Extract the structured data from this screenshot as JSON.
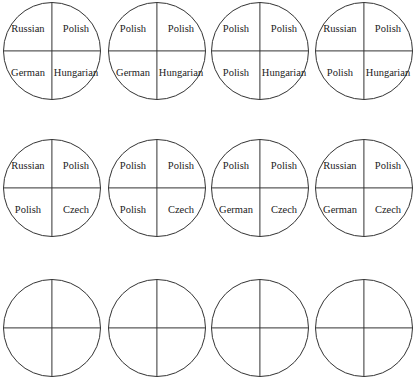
{
  "layout": {
    "rows": 3,
    "cols": 4,
    "colCenters": [
      52,
      157,
      260,
      364
    ],
    "rowCenters": [
      51,
      188,
      328
    ],
    "radius": 49
  },
  "circles": [
    {
      "row": 0,
      "col": 0,
      "tl": "Russian",
      "tr": "Polish",
      "bl": "German",
      "br": "Hungarian"
    },
    {
      "row": 0,
      "col": 1,
      "tl": "Polish",
      "tr": "Polish",
      "bl": "German",
      "br": "Hungarian"
    },
    {
      "row": 0,
      "col": 2,
      "tl": "Polish",
      "tr": "Polish",
      "bl": "Polish",
      "br": "Hungarian"
    },
    {
      "row": 0,
      "col": 3,
      "tl": "Russian",
      "tr": "Polish",
      "bl": "Polish",
      "br": "Hungarian"
    },
    {
      "row": 1,
      "col": 0,
      "tl": "Russian",
      "tr": "Polish",
      "bl": "Polish",
      "br": "Czech"
    },
    {
      "row": 1,
      "col": 1,
      "tl": "Polish",
      "tr": "Polish",
      "bl": "Polish",
      "br": "Czech"
    },
    {
      "row": 1,
      "col": 2,
      "tl": "Polish",
      "tr": "Polish",
      "bl": "German",
      "br": "Czech"
    },
    {
      "row": 1,
      "col": 3,
      "tl": "Russian",
      "tr": "Polish",
      "bl": "German",
      "br": "Czech"
    },
    {
      "row": 2,
      "col": 0,
      "tl": "",
      "tr": "",
      "bl": "",
      "br": ""
    },
    {
      "row": 2,
      "col": 1,
      "tl": "",
      "tr": "",
      "bl": "",
      "br": ""
    },
    {
      "row": 2,
      "col": 2,
      "tl": "",
      "tr": "",
      "bl": "",
      "br": ""
    },
    {
      "row": 2,
      "col": 3,
      "tl": "",
      "tr": "",
      "bl": "",
      "br": ""
    }
  ]
}
